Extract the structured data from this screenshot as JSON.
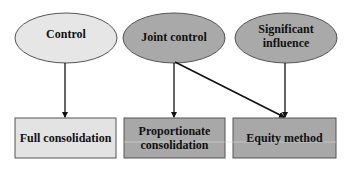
{
  "diagram": {
    "title": "",
    "colors": {
      "light_fill": "#e4e4e4",
      "dark_fill": "#a9a9a9",
      "stroke": "#555555",
      "arrow": "#111111",
      "background": "#ffffff"
    },
    "ellipses": [
      {
        "id": "control",
        "label": "Control",
        "fill": "#e6e6e6"
      },
      {
        "id": "joint-control",
        "label": "Joint control",
        "fill": "#a9a9a9"
      },
      {
        "id": "significant-influence",
        "label": "Significant influence",
        "line1": "Significant",
        "line2": "influence",
        "fill": "#a9a9a9"
      }
    ],
    "boxes": [
      {
        "id": "full-consolidation",
        "label": "Full consolidation",
        "fill": "#e3e3e3"
      },
      {
        "id": "proportionate-consolidation",
        "label": "Proportionate consolidation",
        "line1": "Proportionate",
        "line2": "consolidation",
        "fill": "#a8a8a8"
      },
      {
        "id": "equity-method",
        "label": "Equity method",
        "fill": "#a8a8a8"
      }
    ],
    "edges": [
      {
        "from": "Control",
        "to": "Full consolidation"
      },
      {
        "from": "Joint control",
        "to": "Proportionate consolidation"
      },
      {
        "from": "Joint control",
        "to": "Equity method"
      },
      {
        "from": "Significant influence",
        "to": "Equity method"
      }
    ]
  }
}
